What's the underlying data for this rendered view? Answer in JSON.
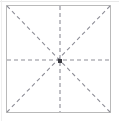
{
  "figure": {
    "title": "",
    "type": "symmetry-guide-diagram",
    "colors": {
      "background": "#ffffff",
      "frame_border": "#b9b9b9",
      "guide_line": "#8d8d96",
      "center_point": "#3b3b41",
      "outer_edge": "#e9e9e9"
    },
    "frame": {
      "label": "square-outline",
      "x": 6,
      "y": 5,
      "width": 105,
      "height": 108,
      "border_width": 1
    },
    "center_point": {
      "label": "center-point",
      "x": 60,
      "y": 61,
      "size": 4
    },
    "guides": [
      {
        "name": "vertical-center-line",
        "orientation": "vertical",
        "x1": 60,
        "y1": 6,
        "x2": 60,
        "y2": 112,
        "style": "dashed"
      },
      {
        "name": "horizontal-center-line",
        "orientation": "horizontal",
        "x1": 7,
        "y1": 60,
        "x2": 110,
        "y2": 60,
        "style": "dashed"
      },
      {
        "name": "diagonal-line-tl-br",
        "orientation": "diagonal",
        "x1": 7,
        "y1": 6,
        "x2": 110,
        "y2": 112,
        "style": "dashed"
      },
      {
        "name": "diagonal-line-tr-bl",
        "orientation": "diagonal",
        "x1": 110,
        "y1": 6,
        "x2": 7,
        "y2": 112,
        "style": "dashed"
      }
    ],
    "dash": {
      "length": 4,
      "gap": 3
    }
  }
}
